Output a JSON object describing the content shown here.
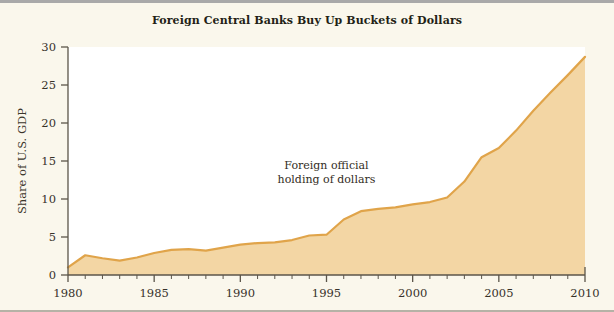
{
  "figure": {
    "background_color": "#faf7ec",
    "border_color": "#a9a9a9"
  },
  "chart_data": {
    "type": "area",
    "title": "Foreign Central Banks Buy Up Buckets of Dollars",
    "xlabel": "",
    "ylabel": "Share of U.S. GDP",
    "xlim": [
      1980,
      2010
    ],
    "ylim": [
      0,
      30
    ],
    "xticks": [
      1980,
      1985,
      1990,
      1995,
      2000,
      2005,
      2010
    ],
    "xtick_labels": [
      "1980",
      "1985",
      "1990",
      "1995",
      "2000",
      "2005",
      "2010"
    ],
    "minor_xtick_interval": 1,
    "yticks": [
      0,
      5,
      10,
      15,
      20,
      25,
      30
    ],
    "ytick_labels": [
      "0",
      "5",
      "10",
      "15",
      "20",
      "25",
      "30"
    ],
    "grid": false,
    "legend": null,
    "annotations": [
      {
        "text_line_1": "Foreign official",
        "text_line_2": "holding of dollars",
        "x": 1995.0,
        "y": 14.0
      }
    ],
    "series": [
      {
        "name": "Foreign official holding of dollars",
        "fill_color": "#f3d6a4",
        "line_color": "#e0a44a",
        "x": [
          1980,
          1981,
          1982,
          1983,
          1984,
          1985,
          1986,
          1987,
          1988,
          1989,
          1990,
          1991,
          1992,
          1993,
          1994,
          1995,
          1996,
          1997,
          1998,
          1999,
          2000,
          2001,
          2002,
          2003,
          2004,
          2005,
          2006,
          2007,
          2008,
          2009,
          2010
        ],
        "values": [
          1.0,
          2.6,
          2.2,
          1.9,
          2.3,
          2.9,
          3.3,
          3.4,
          3.2,
          3.6,
          4.0,
          4.2,
          4.3,
          4.6,
          5.2,
          5.3,
          7.3,
          8.4,
          8.7,
          8.9,
          9.3,
          9.6,
          10.2,
          12.3,
          15.5,
          16.7,
          19.0,
          21.6,
          24.0,
          26.3,
          28.7
        ]
      }
    ]
  }
}
